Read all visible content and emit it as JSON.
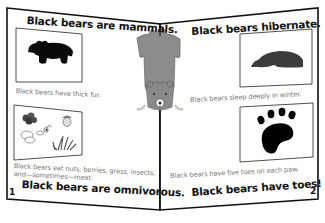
{
  "booklet": {
    "left_page": {
      "page_number": "1",
      "title_top": "Black bears are mammals.",
      "panel1_caption": "Black bears have thick fur.",
      "panel1_icon": "bear-silhouette-icon",
      "panel2_caption_line1": "Black bears eat nuts, berries, grass, insects,",
      "panel2_caption_line2": "and—sometimes—meat.",
      "panel2_icon": "food-items-icon",
      "title_bottom": "Black bears are omnivorous."
    },
    "right_page": {
      "page_number": "2",
      "title_top": "Black bears hibernate.",
      "panel1_caption": "Black bears sleep deeply in winter.",
      "panel1_icon": "sleeping-bear-icon",
      "panel2_caption": "Black bears have five toes on each paw.",
      "panel2_icon": "paw-print-icon",
      "title_bottom": "Black bears have toes!"
    },
    "spine": {
      "icon": "bear-rug-icon"
    },
    "colors": {
      "ink": "#111111",
      "caption_gray": "#777777",
      "bear_gray": "#8c8c8c",
      "bear_dark": "#3a3a3a"
    }
  }
}
